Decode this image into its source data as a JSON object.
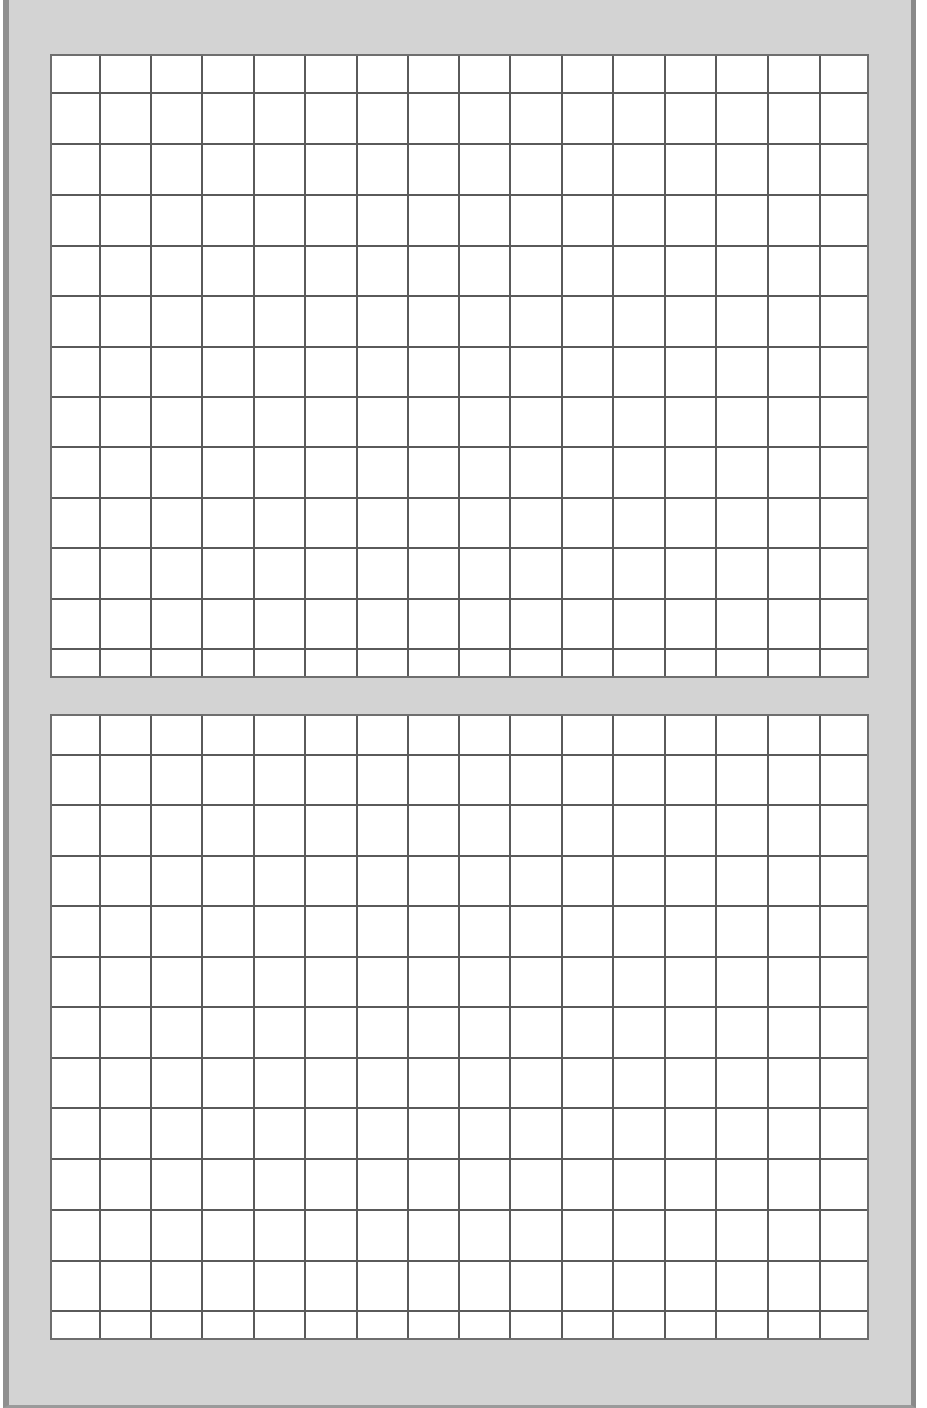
{
  "page": {
    "background": "#ffffff",
    "panel_color": "#d3d3d3",
    "panel_border_color": "#8f8f8f",
    "grid_line_color": "#5a5a5a"
  },
  "grids": [
    {
      "name": "top-grid",
      "left": 50,
      "top": 54,
      "width": 819,
      "height": 624,
      "columns": 16,
      "rows": 13,
      "v_lines": [
        47,
        98,
        149,
        201,
        252,
        304,
        355,
        406,
        457,
        509,
        560,
        612,
        663,
        715,
        767
      ],
      "h_lines": [
        36,
        87,
        138,
        189,
        239,
        290,
        340,
        390,
        441,
        491,
        542,
        592
      ]
    },
    {
      "name": "bottom-grid",
      "left": 50,
      "top": 714,
      "width": 819,
      "height": 626,
      "columns": 16,
      "rows": 13,
      "v_lines": [
        47,
        98,
        149,
        201,
        252,
        304,
        355,
        406,
        457,
        509,
        560,
        612,
        663,
        715,
        767
      ],
      "h_lines": [
        38,
        88,
        139,
        189,
        240,
        290,
        341,
        391,
        442,
        493,
        544,
        594
      ]
    }
  ]
}
